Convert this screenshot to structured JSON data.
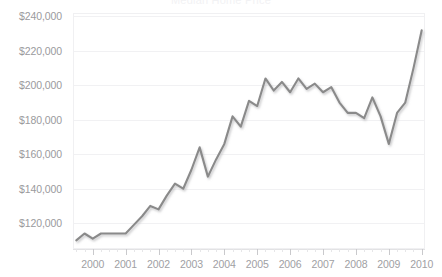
{
  "chart_data": {
    "type": "line",
    "title": "Median Home Price",
    "xlabel": "",
    "ylabel": "",
    "ylim": [
      105000,
      242000
    ],
    "xlim": [
      1999.4,
      2010.1
    ],
    "grid": true,
    "legend": "none",
    "line_color": "#8a8a8a",
    "y_ticks": [
      240000,
      220000,
      200000,
      180000,
      160000,
      140000,
      120000
    ],
    "y_tick_labels": [
      "$240,000",
      "$220,000",
      "$200,000",
      "$180,000",
      "$160,000",
      "$140,000",
      "$120,000"
    ],
    "x_ticks": [
      2000,
      2001,
      2002,
      2003,
      2004,
      2005,
      2006,
      2007,
      2008,
      2009,
      2010
    ],
    "x_tick_labels": [
      "2000",
      "2001",
      "2002",
      "2003",
      "2004",
      "2005",
      "2006",
      "2007",
      "2008",
      "2009",
      "2010"
    ],
    "minor_ticks_per_year": 4,
    "series": [
      {
        "name": "Median Home Price",
        "x": [
          1999.5,
          1999.75,
          2000.0,
          2000.25,
          2000.5,
          2000.75,
          2001.0,
          2001.25,
          2001.5,
          2001.75,
          2002.0,
          2002.25,
          2002.5,
          2002.75,
          2003.0,
          2003.25,
          2003.5,
          2003.75,
          2004.0,
          2004.25,
          2004.5,
          2004.75,
          2005.0,
          2005.25,
          2005.5,
          2005.75,
          2006.0,
          2006.25,
          2006.5,
          2006.75,
          2007.0,
          2007.25,
          2007.5,
          2007.75,
          2008.0,
          2008.25,
          2008.5,
          2008.75,
          2009.0,
          2009.25,
          2009.5,
          2009.75,
          2010.0
        ],
        "values": [
          110000,
          114000,
          111000,
          114000,
          114000,
          114000,
          114000,
          119000,
          124000,
          130000,
          128000,
          136000,
          143000,
          140000,
          151000,
          164000,
          147000,
          157000,
          166000,
          182000,
          176000,
          191000,
          188000,
          204000,
          197000,
          202000,
          196000,
          204000,
          198000,
          201000,
          196000,
          199000,
          190000,
          184000,
          184000,
          181000,
          193000,
          182000,
          166000,
          184000,
          190000,
          210000,
          232000
        ]
      }
    ]
  }
}
